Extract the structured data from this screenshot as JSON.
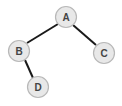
{
  "diagram": {
    "type": "binary-tree",
    "nodes": [
      {
        "id": "A",
        "label": "A",
        "cx": 66,
        "cy": 17,
        "r": 10
      },
      {
        "id": "B",
        "label": "B",
        "cx": 19,
        "cy": 51,
        "r": 10
      },
      {
        "id": "C",
        "label": "C",
        "cx": 104,
        "cy": 53,
        "r": 10
      },
      {
        "id": "D",
        "label": "D",
        "cx": 38,
        "cy": 87,
        "r": 10
      }
    ],
    "edges": [
      {
        "from": "A",
        "to": "B"
      },
      {
        "from": "A",
        "to": "C"
      },
      {
        "from": "B",
        "to": "D"
      }
    ],
    "colors": {
      "node_fill": "#e8e8e8",
      "node_stroke": "#b8b8b8",
      "edge": "#1a1a1a",
      "label": "#444444"
    }
  }
}
